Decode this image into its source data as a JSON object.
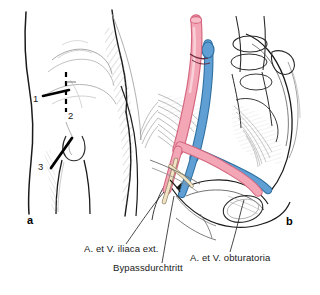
{
  "figure": {
    "type": "medical-anatomical-illustration",
    "background_color": "#ffffff",
    "panels": [
      {
        "letter": "a",
        "name": "surgical-approaches-groin",
        "description": "Line drawing of lower abdomen, groin and upper thigh showing three surgical incision lines",
        "markers": [
          {
            "id": "1",
            "label": "1",
            "incision": "horizontal-solid",
            "x": 36,
            "y": 99
          },
          {
            "id": "2",
            "label": "2",
            "incision": "vertical-dashed",
            "x": 71,
            "y": 117
          },
          {
            "id": "3",
            "label": "3",
            "incision": "oblique-solid",
            "x": 42,
            "y": 168
          }
        ]
      },
      {
        "letter": "b",
        "name": "pelvic-vascular-anatomy-bypass",
        "description": "Pelvis with iliac vessels, obturator vessels and bypass passage"
      }
    ],
    "colors": {
      "artery": "#f2a6b6",
      "artery_outline": "#d4677f",
      "vein": "#5f9fd4",
      "vein_outline": "#2f6f9f",
      "line": "#1a1a1a",
      "hatch": "#7d7d7d",
      "bone": "#2b2b2b"
    },
    "captions": [
      {
        "id": "iliaca",
        "text": "A. et V. iliaca ext.",
        "x": 84,
        "y": 249
      },
      {
        "id": "bypass",
        "text": "Bypassdurchtritt",
        "x": 113,
        "y": 268
      },
      {
        "id": "obturatoria",
        "text": "A. et V. obturatoria",
        "x": 190,
        "y": 257
      }
    ],
    "panel_letters": [
      {
        "text": "a",
        "x": 31,
        "y": 222
      },
      {
        "text": "b",
        "x": 288,
        "y": 223
      }
    ]
  }
}
